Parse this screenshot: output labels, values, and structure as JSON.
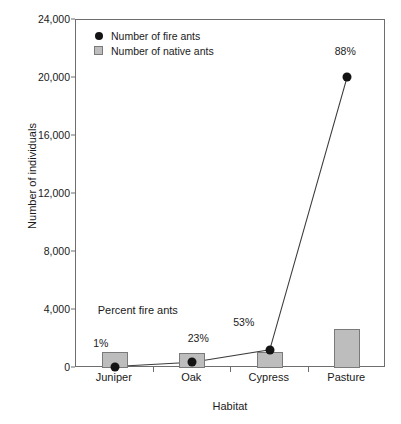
{
  "chart_data": {
    "type": "bar",
    "title": "",
    "xlabel": "Habitat",
    "ylabel": "Number of individuals",
    "categories": [
      "Juniper",
      "Oak",
      "Cypress",
      "Pasture"
    ],
    "ylim": [
      0,
      24000
    ],
    "ytick_labels": [
      "0",
      "4,000",
      "8,000",
      "12,000",
      "16,000",
      "20,000",
      "24,000"
    ],
    "ytick_values": [
      0,
      4000,
      8000,
      12000,
      16000,
      20000,
      24000
    ],
    "grid": false,
    "legend_position": "top-left",
    "series": [
      {
        "name": "Number of fire ants",
        "type": "line",
        "marker": "filled-circle",
        "color": "#141414",
        "values": [
          100,
          400,
          1250,
          20100
        ],
        "point_labels": [
          "1%",
          "23%",
          "53%",
          "88%"
        ]
      },
      {
        "name": "Number of native ants",
        "type": "bar",
        "color": "#bdbdbd",
        "edge_color": "#7a7a7a",
        "values": [
          1100,
          1050,
          1100,
          2700
        ]
      }
    ],
    "annotations": [
      {
        "text": "Percent fire ants",
        "x_category": "Juniper",
        "y_value": 4000
      }
    ]
  },
  "legend": {
    "items": [
      {
        "label": "Number of fire ants",
        "marker": "circle-marker-icon"
      },
      {
        "label": "Number of native ants",
        "marker": "square-marker-icon"
      }
    ]
  },
  "colors": {
    "bar_fill": "#bdbdbd",
    "bar_edge": "#7a7a7a",
    "line": "#3c3c3c",
    "marker": "#141414",
    "axis": "#6e6e6e",
    "text": "#1a1a1a"
  }
}
